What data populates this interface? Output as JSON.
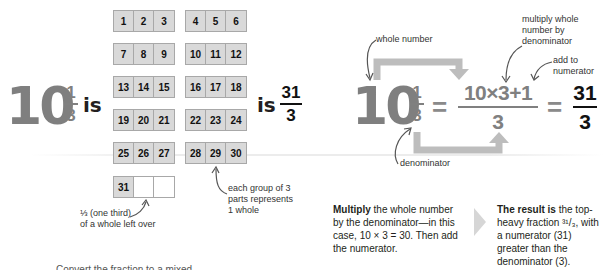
{
  "left": {
    "mixed_number": {
      "whole": "10",
      "numerator": "1",
      "denominator": "3"
    },
    "is_word_1": "is",
    "is_word_2": "is",
    "improper_fraction": {
      "numerator": "31",
      "denominator": "3"
    }
  },
  "grid": {
    "rows": [
      [
        [
          "1",
          "2",
          "3"
        ],
        [
          "4",
          "5",
          "6"
        ]
      ],
      [
        [
          "7",
          "8",
          "9"
        ],
        [
          "10",
          "11",
          "12"
        ]
      ],
      [
        [
          "13",
          "14",
          "15"
        ],
        [
          "16",
          "17",
          "18"
        ]
      ],
      [
        [
          "19",
          "20",
          "21"
        ],
        [
          "22",
          "23",
          "24"
        ]
      ],
      [
        [
          "25",
          "26",
          "27"
        ],
        [
          "28",
          "29",
          "30"
        ]
      ],
      [
        [
          "31",
          "",
          ""
        ]
      ]
    ],
    "colors": {
      "cell_fill": "#d9d9d9",
      "cell_border": "#a8a8a8",
      "empty_fill": "#ffffff"
    },
    "annotation_group": "each group of 3\nparts represents\n1 whole",
    "annotation_leftover_line1": "⅓ (one third)",
    "annotation_leftover_line2": "of a whole left over"
  },
  "equation": {
    "whole": "10",
    "numerator": "1",
    "denominator": "3",
    "equals": "=",
    "mid_numerator": "10×3+1",
    "mid_denominator": "3",
    "result_numerator": "31",
    "result_denominator": "3",
    "labels": {
      "whole_number": "whole number",
      "multiply": "multiply whole\nnumber by\ndenominator",
      "add": "add to\nnumerator",
      "denominator": "denominator"
    },
    "colors": {
      "grey": "#808080",
      "arrow_grey": "#bdbdbd",
      "black": "#111111"
    }
  },
  "explanations": {
    "step1_bold": "Multiply",
    "step1_rest": " the whole number by the denominator—in this case, 10 × 3 = 30. Then add the numerator.",
    "step2_bold": "The result is",
    "step2_rest": " the top-heavy fraction ³¹/₃, with a numerator (31) greater than the denominator (3)."
  },
  "footer_cut_text": "Convert the fraction to a mixed..."
}
